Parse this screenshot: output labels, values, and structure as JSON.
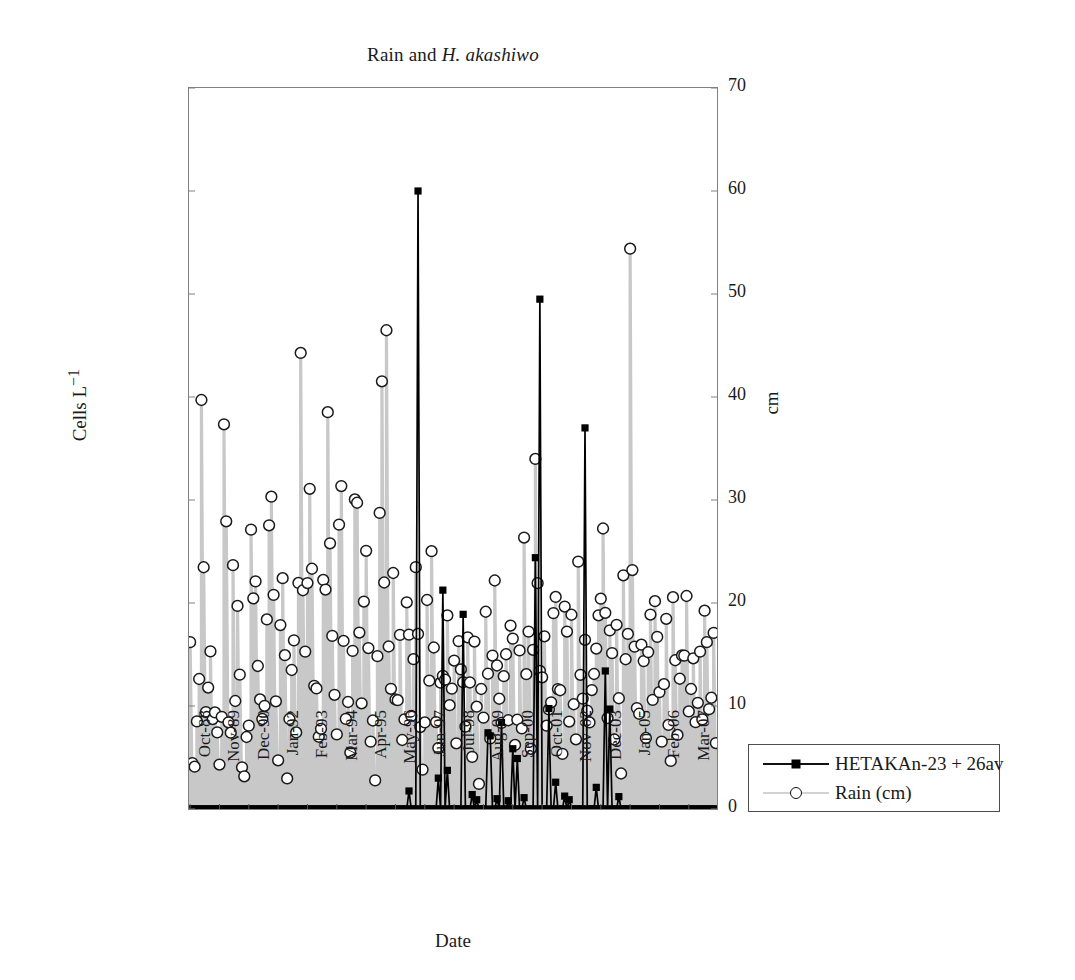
{
  "chart_data": {
    "type": "line",
    "title": "Rain and H. akashiwo",
    "title_plain": "Rain and ",
    "title_italic": "H. akashiwo",
    "xlabel": "Date",
    "ylabel": "Cells L",
    "ylabel_sup": "−1",
    "y2label": "cm",
    "grid": false,
    "legend_position": "right-outside",
    "ylim": [
      0,
      14000000
    ],
    "y2lim": [
      0,
      70
    ],
    "yticks": [
      "0",
      "2,000,000",
      "4,000,000",
      "6,000,000",
      "8,000,000",
      "10,000,000",
      "12,000,000",
      "14,000,000"
    ],
    "ytick_values": [
      0,
      2000000,
      4000000,
      6000000,
      8000000,
      10000000,
      12000000,
      14000000
    ],
    "y2ticks": [
      "0",
      "10",
      "20",
      "30",
      "40",
      "50",
      "60",
      "70"
    ],
    "y2tick_values": [
      0,
      10,
      20,
      30,
      40,
      50,
      60,
      70
    ],
    "xtick_labels": [
      "Oct-88",
      "Nov-89",
      "Dec-90",
      "Jan-92",
      "Feb-93",
      "Mar-94",
      "Apr-95",
      "May-96",
      "Jun-97",
      "Jul-98",
      "Aug-99",
      "Sep-00",
      "Oct-01",
      "Nov-02",
      "Dec-03",
      "Jan-05",
      "Feb-06",
      "Mar-07"
    ],
    "xtick_index": [
      0,
      13,
      26,
      39,
      52,
      65,
      78,
      91,
      104,
      117,
      130,
      143,
      156,
      169,
      182,
      195,
      208,
      221
    ],
    "n_points": 234,
    "series": [
      {
        "name": "HETAKAn-23 + 26av",
        "axis": "left",
        "color": "#000000",
        "marker": "square",
        "values": [
          0,
          0,
          0,
          0,
          0,
          0,
          0,
          0,
          0,
          0,
          0,
          0,
          0,
          0,
          0,
          0,
          0,
          0,
          0,
          0,
          0,
          0,
          0,
          0,
          0,
          0,
          0,
          0,
          0,
          0,
          0,
          0,
          0,
          0,
          0,
          0,
          0,
          0,
          0,
          0,
          0,
          0,
          0,
          0,
          0,
          0,
          0,
          0,
          0,
          0,
          0,
          0,
          0,
          0,
          0,
          0,
          0,
          0,
          0,
          0,
          0,
          0,
          0,
          0,
          0,
          0,
          0,
          0,
          0,
          0,
          0,
          0,
          0,
          0,
          0,
          0,
          0,
          0,
          0,
          0,
          0,
          0,
          0,
          0,
          0,
          0,
          0,
          0,
          0,
          0,
          0,
          0,
          0,
          0,
          0,
          0,
          0,
          350000,
          0,
          0,
          0,
          12000000,
          0,
          0,
          0,
          0,
          0,
          0,
          0,
          0,
          600000,
          0,
          4250000,
          0,
          750000,
          0,
          0,
          0,
          0,
          0,
          0,
          3780000,
          0,
          0,
          0,
          280000,
          0,
          180000,
          0,
          0,
          0,
          0,
          1480000,
          1420000,
          0,
          0,
          200000,
          0,
          1680000,
          0,
          0,
          160000,
          0,
          1170000,
          0,
          980000,
          0,
          0,
          220000,
          0,
          0,
          0,
          0,
          4880000,
          0,
          9900000,
          0,
          0,
          0,
          1950000,
          0,
          0,
          520000,
          0,
          0,
          0,
          250000,
          0,
          180000,
          0,
          0,
          0,
          0,
          0,
          0,
          7400000,
          0,
          0,
          0,
          0,
          420000,
          0,
          0,
          0,
          2680000,
          0,
          1940000,
          0,
          0,
          0,
          240000,
          0,
          0,
          0,
          0,
          0,
          0,
          0,
          0,
          0,
          0,
          0,
          0,
          0,
          0,
          0,
          0
        ],
        "peaks": [
          {
            "label": "May-96",
            "value": 12000000
          },
          {
            "label": "Nov-02",
            "value": 9900000
          },
          {
            "label": "Jan-05",
            "value": 7400000
          },
          {
            "label": "Jun-97",
            "value": 4250000
          },
          {
            "label": "Jul-98",
            "value": 3780000
          },
          {
            "label": "Feb-06",
            "value": 2680000
          },
          {
            "label": "Nov-02 b",
            "value": 1950000
          },
          {
            "label": "Feb-06 b",
            "value": 1940000
          },
          {
            "label": "Sep-00",
            "value": 1680000
          },
          {
            "label": "Aug-99",
            "value": 1480000
          }
        ]
      },
      {
        "name": "Rain (cm)",
        "axis": "right",
        "color": "#c8c8c8",
        "marker": "circle",
        "values": [
          16.2,
          4.5,
          3.6,
          9.0,
          5.5,
          43.2,
          28.4,
          11.0,
          6.2,
          21.0,
          7.6,
          10.0,
          8.8,
          6.4,
          3.0,
          12.0,
          47.8,
          21.5,
          5.2,
          7.8,
          25.5,
          9.6,
          19.8,
          13.4,
          4.2,
          2.4,
          8.2,
          1.5,
          30.5,
          18.2,
          25.2,
          16.8,
          9.8,
          11.6,
          6.0,
          13.2,
          21.8,
          30.6,
          30.2,
          17.6,
          8.6,
          4.0,
          19.6,
          22.6,
          14.8,
          2.8,
          8.4,
          12.8,
          18.4,
          6.6,
          10.4,
          53.8,
          23.4,
          17.4,
          12.2,
          33.6,
          28.6,
          19.0,
          7.2,
          14.2,
          3.8,
          9.2,
          25.8,
          20.4,
          41.0,
          24.6,
          16.6,
          11.2,
          5.8,
          26.8,
          33.8,
          18.8,
          7.0,
          13.8,
          2.6,
          10.8,
          22.2,
          39.8,
          19.4,
          15.2,
          6.8,
          27.8,
          23.8,
          12.6,
          4.8,
          9.4,
          1.8,
          16.0,
          29.2,
          41.8,
          20.2,
          50.0,
          17.2,
          8.0,
          26.2,
          13.0,
          5.0,
          21.2,
          10.2,
          2.2,
          15.6,
          24.0,
          11.8,
          7.4,
          18.0,
          25.6,
          14.4,
          6.5,
          3.4,
          8.9,
          20.8,
          12.4,
          25.5,
          16.4,
          9.1,
          4.6,
          11.4,
          15.0,
          7.8,
          22.0,
          13.6,
          5.4,
          18.6,
          10.6,
          3.2,
          24.4,
          8.1,
          14.0,
          6.1,
          19.2,
          11.1,
          4.4,
          16.9,
          9.9,
          2.0,
          12.1,
          7.1,
          20.0,
          15.4,
          5.6,
          10.1,
          24.8,
          17.8,
          8.6,
          13.1,
          3.9,
          19.9,
          11.9,
          6.9,
          22.4,
          14.6,
          4.1,
          9.5,
          16.1,
          7.3,
          26.6,
          12.9,
          18.3,
          5.1,
          10.9,
          36.8,
          24.2,
          15.8,
          8.3,
          20.6,
          11.3,
          4.3,
          14.9,
          6.7,
          27.2,
          17.0,
          9.3,
          12.3,
          3.5,
          22.8,
          16.5,
          7.9,
          19.1,
          10.3,
          5.3,
          25.4,
          13.9,
          8.7,
          18.1,
          11.7,
          4.7,
          15.1,
          6.3,
          21.4,
          9.7,
          26.4,
          16.3,
          33.4,
          12.5,
          7.5,
          20.1,
          14.1,
          5.7,
          18.9,
          10.5,
          3.1,
          23.2,
          15.3,
          8.5,
          62.0,
          25.1,
          17.6,
          11.5,
          6.6,
          13.3,
          19.3,
          9.2,
          4.9,
          22.6,
          16.7,
          7.7,
          24.9,
          14.3,
          10.7,
          5.9,
          12.7,
          18.7,
          8.2,
          3.7,
          21.1,
          15.9,
          6.2,
          11.2,
          17.1,
          9.6,
          25.2,
          13.5,
          4.2,
          19.7,
          10.1,
          7.2,
          12.2,
          16.8,
          5.5,
          23.5,
          14.5,
          8.9,
          11.0,
          17.4,
          6.4
        ],
        "max_value": 62.0,
        "max_label": "Jan-05"
      }
    ]
  }
}
